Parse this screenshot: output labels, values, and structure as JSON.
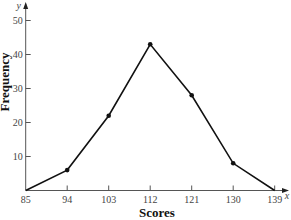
{
  "chart_data": {
    "type": "line",
    "title": "",
    "xlabel": "Scores",
    "ylabel": "Frequency",
    "x_axis_letter": "x",
    "y_axis_letter": "y",
    "categories": [
      "85",
      "94",
      "103",
      "112",
      "121",
      "130",
      "139"
    ],
    "x": [
      85,
      94,
      103,
      112,
      121,
      130,
      139
    ],
    "values": [
      0,
      6,
      22,
      43,
      28,
      8,
      0
    ],
    "series": [
      {
        "name": "Frequency polygon",
        "values": [
          0,
          6,
          22,
          43,
          28,
          8,
          0
        ]
      }
    ],
    "y_ticks": [
      10,
      20,
      30,
      40,
      50
    ],
    "ylim": [
      0,
      52
    ],
    "xlim": [
      85,
      141
    ],
    "grid": false,
    "legend": "none",
    "markers": "filled circles on interior points",
    "line_color": "#111111"
  }
}
